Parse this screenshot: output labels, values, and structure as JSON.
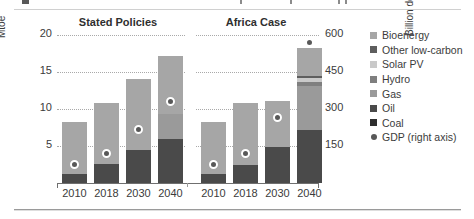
{
  "chart_data": {
    "type": "bar",
    "title": "",
    "subtitle": "",
    "stacked": true,
    "grid": true,
    "legend_position": "right",
    "panels": [
      {
        "name": "Stated Policies",
        "categories": [
          "2010",
          "2018",
          "2030",
          "2040"
        ],
        "series": [
          {
            "name": "Coal",
            "values": [
              0.0,
              0.0,
              0.0,
              0.0
            ]
          },
          {
            "name": "Oil",
            "values": [
              1.2,
              2.6,
              4.5,
              5.9
            ]
          },
          {
            "name": "Gas",
            "values": [
              0.0,
              0.0,
              0.0,
              3.4
            ]
          },
          {
            "name": "Hydro",
            "values": [
              0.0,
              0.0,
              0.0,
              0.0
            ]
          },
          {
            "name": "Solar PV",
            "values": [
              0.0,
              0.0,
              0.0,
              0.0
            ]
          },
          {
            "name": "Other low-carbon",
            "values": [
              0.0,
              0.0,
              0.0,
              0.0
            ]
          },
          {
            "name": "Bioenergy",
            "values": [
              7.1,
              8.2,
              9.6,
              7.9
            ]
          }
        ],
        "totals": [
          8.3,
          10.8,
          14.1,
          17.2
        ],
        "gdp": [
          75,
          120,
          218,
          330
        ]
      },
      {
        "name": "Africa Case",
        "categories": [
          "2010",
          "2018",
          "2030",
          "2040"
        ],
        "series": [
          {
            "name": "Coal",
            "values": [
              0.0,
              0.0,
              0.0,
              0.0
            ]
          },
          {
            "name": "Oil",
            "values": [
              1.2,
              2.5,
              4.9,
              7.2
            ]
          },
          {
            "name": "Gas",
            "values": [
              0.0,
              0.0,
              0.0,
              5.9
            ]
          },
          {
            "name": "Hydro",
            "values": [
              0.0,
              0.0,
              0.0,
              0.6
            ]
          },
          {
            "name": "Solar PV",
            "values": [
              0.0,
              0.0,
              0.0,
              0.5
            ]
          },
          {
            "name": "Other low-carbon",
            "values": [
              0.0,
              0.0,
              0.0,
              0.2
            ]
          },
          {
            "name": "Bioenergy",
            "values": [
              7.1,
              8.3,
              6.2,
              3.8
            ]
          }
        ],
        "totals": [
          8.3,
          10.8,
          11.1,
          18.2
        ],
        "gdp": [
          75,
          120,
          265,
          570
        ]
      }
    ],
    "left_axis": {
      "label": "Mtoe",
      "ticks": [
        "5",
        "10",
        "15",
        "20"
      ],
      "min": 0,
      "max": 20
    },
    "right_axis": {
      "label": "Billion dollars (2018)",
      "ticks": [
        "150",
        "300",
        "450",
        "600"
      ],
      "min": 0,
      "max": 600
    },
    "legend": [
      {
        "label": "Bioenergy",
        "color": "#a6a6a6",
        "marker": "square"
      },
      {
        "label": "Other low-carbon",
        "color": "#5e5e5e",
        "marker": "square"
      },
      {
        "label": "Solar PV",
        "color": "#c9c9c9",
        "marker": "square"
      },
      {
        "label": "Hydro",
        "color": "#7f7f7f",
        "marker": "square"
      },
      {
        "label": "Gas",
        "color": "#9a9a9a",
        "marker": "square"
      },
      {
        "label": "Oil",
        "color": "#4a4a4a",
        "marker": "square"
      },
      {
        "label": "Coal",
        "color": "#2e2e2e",
        "marker": "square"
      },
      {
        "label": "GDP (right axis)",
        "color": "#585858",
        "marker": "circle"
      }
    ]
  }
}
